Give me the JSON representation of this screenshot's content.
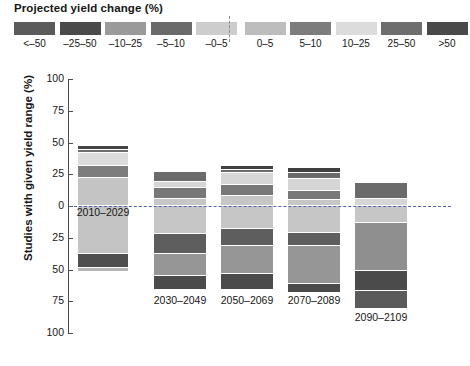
{
  "legend": {
    "title": "Projected yield change (%)",
    "divider": "dashed-zero-divider",
    "items": [
      {
        "label": "<–50",
        "color": "#5b5b5b"
      },
      {
        "label": "–25–50",
        "color": "#4a4a4a"
      },
      {
        "label": "–10–25",
        "color": "#9a9a9a"
      },
      {
        "label": "–5–10",
        "color": "#6a6a6a"
      },
      {
        "label": "–0–5",
        "color": "#cdcdcd"
      },
      {
        "label": "0–5",
        "color": "#bdbdbd"
      },
      {
        "label": "5–10",
        "color": "#7d7d7d"
      },
      {
        "label": "10–25",
        "color": "#dcdcdc"
      },
      {
        "label": "25–50",
        "color": "#6e6e6e"
      },
      {
        "label": ">50",
        "color": "#494949"
      }
    ]
  },
  "axis": {
    "ylabel": "Studies with given yield range (%)",
    "yticks": [
      "100",
      "75",
      "50",
      "25",
      "0",
      "25",
      "50",
      "75",
      "100"
    ],
    "zero_label": "0"
  },
  "chart_data": {
    "type": "bar",
    "title": "Projected yield change (%)",
    "subtitle": "",
    "xlabel": "",
    "ylabel": "Studies with given yield range (%)",
    "ylim": [
      -100,
      100
    ],
    "grid": false,
    "legend_position": "top",
    "stacked": true,
    "note": "Diverging stacked bars: positive yield-change categories stack upward from 0, negative categories stack downward from 0. Values are percent of studies.",
    "categories": [
      "2010–2029",
      "2030–2049",
      "2050–2069",
      "2070–2089",
      "2090–2109"
    ],
    "series": [
      {
        "name": ">50",
        "color": "#494949",
        "values": [
          2,
          2,
          2,
          2,
          0
        ]
      },
      {
        "name": "25–50",
        "color": "#6e6e6e",
        "values": [
          2,
          7,
          5,
          9,
          15
        ]
      },
      {
        "name": "10–25",
        "color": "#dcdcdc",
        "values": [
          5,
          3,
          3,
          7,
          5
        ]
      },
      {
        "name": "5–10",
        "color": "#7d7d7d",
        "values": [
          9,
          8,
          8,
          6,
          0
        ]
      },
      {
        "name": "0–5",
        "color": "#bdbdbd",
        "values": [
          5,
          7,
          6,
          12,
          13
        ]
      },
      {
        "name": "–0–5",
        "color": "#cdcdcd",
        "values": [
          -35,
          -20,
          -11,
          -22,
          -22
        ]
      },
      {
        "name": "–5–10",
        "color": "#6a6a6a",
        "values": [
          0,
          -12,
          -12,
          -8,
          0
        ]
      },
      {
        "name": "–10–25",
        "color": "#9a9a9a",
        "values": [
          0,
          -15,
          -20,
          -26,
          -20
        ]
      },
      {
        "name": "–25–50",
        "color": "#4a4a4a",
        "values": [
          -12,
          -8,
          -12,
          -6,
          -16
        ]
      },
      {
        "name": "<–50",
        "color": "#5b5b5b",
        "values": [
          -2,
          0,
          0,
          0,
          -14
        ]
      }
    ]
  },
  "bars": [
    {
      "label": "2010–2029",
      "x": 78,
      "width": 50,
      "label_y": 206,
      "segments": [
        {
          "name": ">50",
          "color": "#454545",
          "top": 146,
          "height": 4
        },
        {
          "name": "25–50",
          "color": "#6e6e6e",
          "top": 150,
          "height": 3
        },
        {
          "name": "10–25",
          "color": "#dcdcdc",
          "top": 153,
          "height": 13
        },
        {
          "name": "5–10",
          "color": "#7d7d7d",
          "color2": "#757575",
          "top": 166,
          "height": 12
        },
        {
          "name": "0–5",
          "color": "#c4c4c4",
          "top": 178,
          "height": 28
        },
        {
          "name": "–0–5",
          "color": "#c4c4c4",
          "top": 206,
          "height": 48
        },
        {
          "name": "–25–50",
          "color": "#4f4f4f",
          "top": 254,
          "height": 14
        },
        {
          "name": "<–50",
          "color": "#b5b5b5",
          "top": 268,
          "height": 4
        }
      ]
    },
    {
      "label": "2030–2049",
      "x": 154,
      "width": 52,
      "label_y": 294,
      "segments": [
        {
          "name": "25–50",
          "color": "#6b6b6b",
          "top": 172,
          "height": 10
        },
        {
          "name": "10–25",
          "color": "#d6d6d6",
          "top": 182,
          "height": 6
        },
        {
          "name": "5–10",
          "color": "#787878",
          "top": 188,
          "height": 11
        },
        {
          "name": "0–5",
          "color": "#c6c6c6",
          "top": 199,
          "height": 7
        },
        {
          "name": "–0–5",
          "color": "#c6c6c6",
          "top": 206,
          "height": 28
        },
        {
          "name": "–5–10",
          "color": "#5e5e5e",
          "top": 234,
          "height": 20
        },
        {
          "name": "–10–25",
          "color": "#969696",
          "top": 254,
          "height": 22
        },
        {
          "name": "–25–50",
          "color": "#4b4b4b",
          "top": 276,
          "height": 14
        }
      ]
    },
    {
      "label": "2050–2069",
      "x": 221,
      "width": 52,
      "label_y": 294,
      "segments": [
        {
          "name": ">50",
          "color": "#414141",
          "top": 166,
          "height": 4
        },
        {
          "name": "25–50",
          "color": "#6b6b6b",
          "top": 170,
          "height": 3
        },
        {
          "name": "10–25",
          "color": "#d6d6d6",
          "top": 173,
          "height": 12
        },
        {
          "name": "5–10",
          "color": "#787878",
          "top": 185,
          "height": 11
        },
        {
          "name": "0–5",
          "color": "#c6c6c6",
          "top": 196,
          "height": 10
        },
        {
          "name": "–0–5",
          "color": "#c6c6c6",
          "top": 206,
          "height": 23
        },
        {
          "name": "–5–10",
          "color": "#5e5e5e",
          "top": 229,
          "height": 17
        },
        {
          "name": "–10–25",
          "color": "#969696",
          "top": 246,
          "height": 28
        },
        {
          "name": "–25–50",
          "color": "#4b4b4b",
          "top": 274,
          "height": 16
        }
      ]
    },
    {
      "label": "2070–2089",
      "x": 288,
      "width": 52,
      "label_y": 294,
      "segments": [
        {
          "name": ">50",
          "color": "#414141",
          "top": 168,
          "height": 5
        },
        {
          "name": "25–50",
          "color": "#6b6b6b",
          "top": 173,
          "height": 6
        },
        {
          "name": "10–25",
          "color": "#d6d6d6",
          "top": 179,
          "height": 12
        },
        {
          "name": "5–10",
          "color": "#787878",
          "top": 191,
          "height": 9
        },
        {
          "name": "0–5",
          "color": "#c6c6c6",
          "top": 200,
          "height": 6
        },
        {
          "name": "–0–5",
          "color": "#c6c6c6",
          "top": 206,
          "height": 27
        },
        {
          "name": "–5–10",
          "color": "#5e5e5e",
          "top": 233,
          "height": 13
        },
        {
          "name": "–10–25",
          "color": "#969696",
          "top": 246,
          "height": 38
        },
        {
          "name": "–25–50",
          "color": "#4b4b4b",
          "top": 284,
          "height": 9
        }
      ]
    },
    {
      "label": "2090–2109",
      "x": 355,
      "width": 52,
      "label_y": 311,
      "segments": [
        {
          "name": "25–50",
          "color": "#6b6b6b",
          "top": 183,
          "height": 16
        },
        {
          "name": "10–25",
          "color": "#d6d6d6",
          "top": 199,
          "height": 7
        },
        {
          "name": "–0–5",
          "color": "#c6c6c6",
          "top": 206,
          "height": 17
        },
        {
          "name": "–10–25",
          "color": "#8f8f8f",
          "top": 223,
          "height": 48
        },
        {
          "name": "–25–50",
          "color": "#4b4b4b",
          "top": 271,
          "height": 20
        },
        {
          "name": "<–50",
          "color": "#5b5b5b",
          "top": 291,
          "height": 18
        }
      ]
    }
  ]
}
